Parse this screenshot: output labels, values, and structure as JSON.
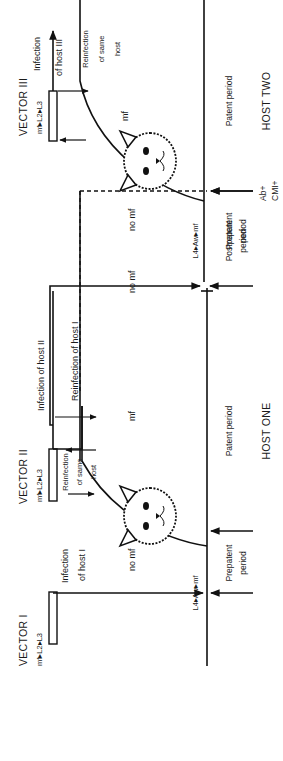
{
  "diagram": {
    "orientation": "rotated-90-ccw",
    "vectors": [
      {
        "id": "vector-1",
        "label": "VECTOR I",
        "stages": "mf▸L2▸L3"
      },
      {
        "id": "vector-2",
        "label": "VECTOR II",
        "stages": "mf▸L2▸L3"
      },
      {
        "id": "vector-3",
        "label": "VECTOR III",
        "stages": "mf▸L2▸L3"
      }
    ],
    "hosts": [
      {
        "id": "host-one",
        "label": "HOST ONE"
      },
      {
        "id": "host-two",
        "label": "HOST TWO"
      }
    ],
    "events": {
      "infection_host_1_line1": "Infection",
      "infection_host_1_line2": "of host I",
      "reinfection_same_host_a_1": "Reinfection",
      "reinfection_same_host_a_2": "of same",
      "reinfection_same_host_a_3": "host",
      "reinfection_host_1": "Reinfection of host I",
      "infection_host_2": "Infection of host II",
      "infection_host_3_line1": "Infection",
      "infection_host_3_line2": "of host III",
      "reinfection_same_host_b_1": "Reinfection",
      "reinfection_same_host_b_2": "of same",
      "reinfection_same_host_b_3": "host"
    },
    "states": {
      "no_mf_1": "no mf",
      "mf_1": "mf",
      "no_mf_2": "no mf",
      "no_mf_3": "no mf",
      "mf_2": "mf",
      "development_1": "L4▸Aw▸mf",
      "development_2": "L4▸Aw▸mf"
    },
    "periods": {
      "prepatent_1_line1": "Prepatent",
      "prepatent_1_line2": "period",
      "patent_1": "Patent period",
      "postpatent_line1": "Postpatent",
      "postpatent_line2": "period",
      "immune_line1": "Ab+",
      "immune_line2": "CMI+",
      "prepatent_2_line1": "Prepatent",
      "prepatent_2_line2": "period",
      "patent_2": "Patent period"
    },
    "colors": {
      "ink": "#111111",
      "background": "#ffffff"
    }
  }
}
